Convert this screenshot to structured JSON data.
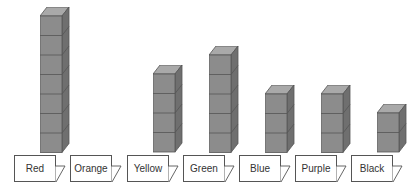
{
  "chart_data": {
    "type": "bar",
    "title": "",
    "categories": [
      "Red",
      "Orange",
      "Yellow",
      "Green",
      "Blue",
      "Purple",
      "Black"
    ],
    "values": [
      7,
      0,
      4,
      5,
      3,
      3,
      2
    ],
    "unit": "cubes"
  },
  "cards": [
    {
      "label": "Red",
      "x": 14,
      "cubes": 7
    },
    {
      "label": "Orange",
      "x": 70,
      "cubes": 0
    },
    {
      "label": "Yellow",
      "x": 127,
      "cubes": 4
    },
    {
      "label": "Green",
      "x": 183,
      "cubes": 5
    },
    {
      "label": "Blue",
      "x": 239,
      "cubes": 3
    },
    {
      "label": "Purple",
      "x": 295,
      "cubes": 3
    },
    {
      "label": "Black",
      "x": 351,
      "cubes": 2
    }
  ],
  "colors": {
    "cube_front": "#8c8c8c",
    "cube_side": "#6f6f6f",
    "cube_top": "#a9a9a9",
    "edge": "#555555"
  }
}
